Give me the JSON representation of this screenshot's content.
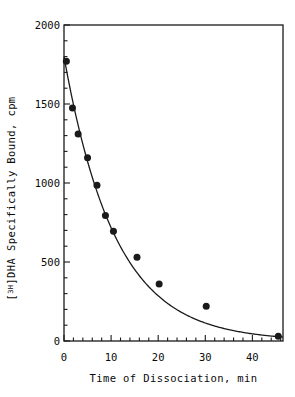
{
  "chart_data": {
    "type": "scatter",
    "title": "",
    "xlabel": "Time of Dissociation,  min",
    "ylabel_plain": "[3H]DHA Specifically Bound,  cpm",
    "ylabel_prefix": "[",
    "ylabel_superscript": "3H",
    "ylabel_suffix": "]DHA Specifically Bound,  cpm",
    "xlim": [
      0,
      46.5
    ],
    "ylim": [
      0,
      2000
    ],
    "xticks": [
      0,
      10,
      20,
      30,
      40
    ],
    "xtick_labels": [
      "0",
      "10",
      "20",
      "30",
      "40"
    ],
    "yticks": [
      0,
      500,
      1000,
      1500,
      2000
    ],
    "ytick_labels": [
      "0",
      "500",
      "1000",
      "1500",
      "2000"
    ],
    "x_minor_tick_interval": 2,
    "y_minor_tick_interval": 100,
    "grid": false,
    "legend": null,
    "marker": "filled-circle",
    "marker_color": "#1a1a1a",
    "marker_size_px": 7,
    "line_color": "#1a1a1a",
    "x": [
      0.5,
      1.8,
      3.0,
      5.0,
      7.0,
      8.8,
      10.5,
      15.5,
      20.2,
      30.2,
      45.5
    ],
    "values": [
      1770,
      1475,
      1310,
      1160,
      985,
      795,
      695,
      530,
      360,
      220,
      30
    ],
    "points": [
      {
        "x": 0.5,
        "y": 1770
      },
      {
        "x": 1.8,
        "y": 1475
      },
      {
        "x": 3.0,
        "y": 1310
      },
      {
        "x": 5.0,
        "y": 1160
      },
      {
        "x": 7.0,
        "y": 985
      },
      {
        "x": 8.8,
        "y": 795
      },
      {
        "x": 10.5,
        "y": 695
      },
      {
        "x": 15.5,
        "y": 530
      },
      {
        "x": 20.2,
        "y": 360
      },
      {
        "x": 30.2,
        "y": 220
      },
      {
        "x": 45.5,
        "y": 30
      }
    ],
    "fit_curve": {
      "model": "monoexponential-decay",
      "equation": "y = A * exp(-k * t)",
      "A": 1800,
      "k": 0.092
    }
  }
}
